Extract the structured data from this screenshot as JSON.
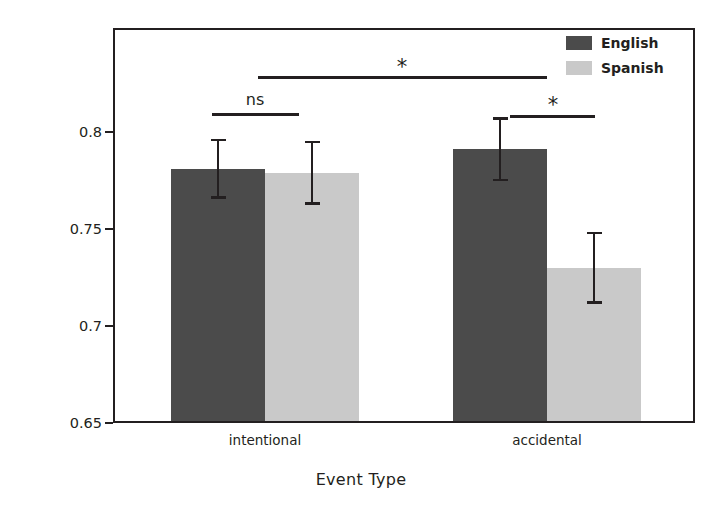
{
  "chart_data": {
    "type": "bar",
    "title": "",
    "xlabel": "Event Type",
    "ylabel": "Proportion correct",
    "categories": [
      "intentional",
      "accidental"
    ],
    "ylim": [
      0.65,
      0.8535
    ],
    "yticks": [
      0.8,
      0.75,
      0.7,
      0.65
    ],
    "ytick_labels": [
      "0.8",
      "0.75",
      "0.7",
      "0.65"
    ],
    "grid": false,
    "legend_position": "top-right",
    "series": [
      {
        "name": "English",
        "color": "#4b4b4b",
        "values": [
          0.781,
          0.791
        ],
        "errors_low": [
          0.7655,
          0.7745
        ],
        "errors_high": [
          0.7965,
          0.8075
        ]
      },
      {
        "name": "Spanish",
        "color": "#c9c9c9",
        "values": [
          0.779,
          0.73
        ],
        "errors_low": [
          0.7625,
          0.7115
        ],
        "errors_high": [
          0.7955,
          0.7485
        ]
      }
    ],
    "annotations": [
      {
        "label": "ns",
        "from": "intentional-english",
        "to": "intentional-spanish"
      },
      {
        "label": "*",
        "from": "accidental-english",
        "to": "accidental-spanish"
      },
      {
        "label": "*",
        "from": "intentional-group",
        "to": "accidental-group"
      }
    ]
  },
  "axes": {
    "ylabel": "Proportion correct",
    "xlabel": "Event Type",
    "yticks": [
      {
        "label": "0.8",
        "value": 0.8
      },
      {
        "label": "0.75",
        "value": 0.75
      },
      {
        "label": "0.7",
        "value": 0.7
      },
      {
        "label": "0.65",
        "value": 0.65
      }
    ],
    "xticks": [
      {
        "label": "intentional"
      },
      {
        "label": "accidental"
      }
    ]
  },
  "legend": {
    "items": [
      {
        "label": "English",
        "color": "#4b4b4b"
      },
      {
        "label": "Spanish",
        "color": "#c9c9c9"
      }
    ]
  },
  "significance": {
    "ns_label": "ns",
    "star_right_label": "*",
    "star_top_label": "*"
  },
  "colors": {
    "english": "#4b4b4b",
    "spanish": "#c9c9c9",
    "ink": "#231f20",
    "background": "#ffffff"
  }
}
